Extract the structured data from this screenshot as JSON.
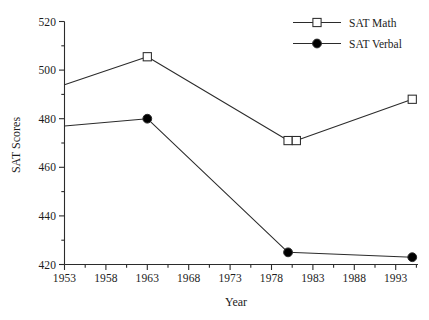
{
  "chart_data": {
    "type": "line",
    "title": "",
    "xlabel": "Year",
    "ylabel": "SAT Scores",
    "xlim": [
      1953,
      1996
    ],
    "ylim": [
      420,
      520
    ],
    "grid": false,
    "legend_position": "top-right",
    "x_ticks": [
      1953,
      1958,
      1963,
      1968,
      1973,
      1978,
      1983,
      1988,
      1993
    ],
    "x_tick_labels": [
      "1953",
      "1958",
      "1963",
      "1968",
      "1973",
      "1978",
      "1983",
      "1988",
      "1993"
    ],
    "x_minor_tick_interval": 2.5,
    "y_ticks": [
      420,
      440,
      460,
      480,
      500,
      520
    ],
    "y_tick_labels": [
      "420",
      "440",
      "460",
      "480",
      "500",
      "520"
    ],
    "y_minor_tick_interval": 10,
    "series": [
      {
        "name": "SAT Math",
        "marker": "open-square",
        "color": "#1c1c1c",
        "x": [
          1953,
          1963,
          1980,
          1981,
          1995
        ],
        "values": [
          494,
          505.5,
          471,
          471,
          488
        ],
        "marker_visible": [
          false,
          true,
          true,
          true,
          true
        ]
      },
      {
        "name": "SAT Verbal",
        "marker": "filled-circle",
        "color": "#1c1c1c",
        "x": [
          1953,
          1963,
          1980,
          1995
        ],
        "values": [
          477,
          480,
          425,
          423
        ],
        "marker_visible": [
          false,
          true,
          true,
          true
        ]
      }
    ]
  },
  "axes": {
    "y_title": "SAT Scores",
    "x_title": "Year"
  },
  "legend": {
    "entries": [
      {
        "label": "SAT Math",
        "marker": "open-square"
      },
      {
        "label": "SAT Verbal",
        "marker": "filled-circle"
      }
    ]
  },
  "colors": {
    "line": "#2b2b2b",
    "axis": "#2b2b2b",
    "text": "#1c1c1c",
    "background": "#ffffff",
    "marker_fill_open": "#ffffff",
    "marker_fill_solid": "#000000"
  }
}
